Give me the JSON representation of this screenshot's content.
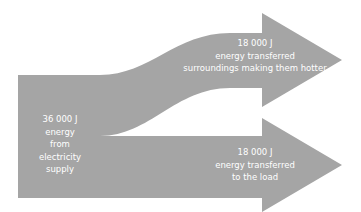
{
  "colors": {
    "arrow_fill": "#a5a5a5",
    "text": "#ffffff",
    "background": "#ffffff"
  },
  "source": {
    "lines": [
      "36 000 J",
      "energy",
      "from",
      "electricity",
      "supply"
    ]
  },
  "outputs": [
    {
      "lines": [
        "18 000 J",
        "energy transferred",
        "surroundings making them hotter"
      ]
    },
    {
      "lines": [
        "18 000 J",
        "energy transferred",
        "to the load"
      ]
    }
  ]
}
